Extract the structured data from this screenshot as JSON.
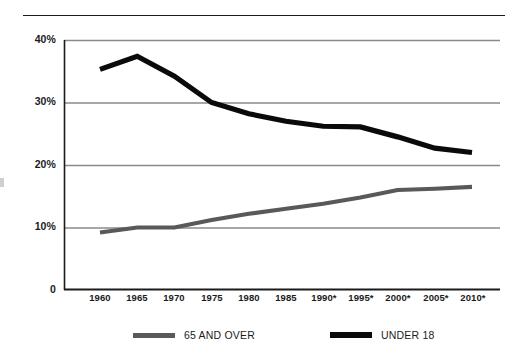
{
  "chart_data": {
    "type": "line",
    "title": "",
    "subtitle": "",
    "xlabel": "",
    "ylabel": "",
    "x": [
      "1960",
      "1965",
      "1970",
      "1975",
      "1980",
      "1985",
      "1990*",
      "1995*",
      "2000*",
      "2005*",
      "2010*"
    ],
    "categories": [
      "1960",
      "1965",
      "1970",
      "1975",
      "1980",
      "1985",
      "1990*",
      "1995*",
      "2000*",
      "2005*",
      "2010*"
    ],
    "series": [
      {
        "name": "65 AND OVER",
        "color": "#595959",
        "values": [
          9.2,
          10.0,
          10.0,
          11.2,
          12.2,
          13.0,
          13.8,
          14.8,
          16.0,
          16.2,
          16.5
        ]
      },
      {
        "name": "UNDER 18",
        "color": "#0a0a0a",
        "values": [
          35.3,
          37.4,
          34.2,
          30.0,
          28.2,
          27.0,
          26.2,
          26.1,
          24.5,
          22.7,
          22.0
        ]
      }
    ],
    "ylim": [
      0,
      40
    ],
    "ytick_values": [
      40,
      30,
      20,
      10,
      0
    ],
    "ytick_labels": [
      "40%",
      "30%",
      "20%",
      "10%",
      "0"
    ],
    "grid": true,
    "grid_axis": "y",
    "legend_position": "bottom",
    "legend_entries": [
      "65 AND OVER",
      "UNDER 18"
    ],
    "axis_color": "#1b1b1b",
    "grid_color": "#8a8a8a",
    "background": "#ffffff"
  },
  "axes": {
    "y_labels": [
      "40%",
      "30%",
      "20%",
      "10%",
      "0"
    ],
    "x_labels": [
      "1960",
      "1965",
      "1970",
      "1975",
      "1980",
      "1985",
      "1990*",
      "1995*",
      "2000*",
      "2005*",
      "2010*"
    ]
  },
  "legend": {
    "items": [
      {
        "label": "65 AND OVER",
        "color": "#595959"
      },
      {
        "label": "UNDER 18",
        "color": "#0a0a0a"
      }
    ]
  }
}
